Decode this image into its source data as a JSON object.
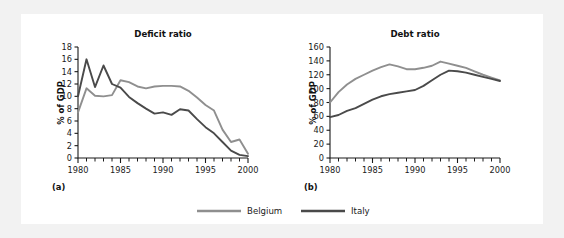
{
  "figure": {
    "background_color": "#f2f2f2",
    "panel_color": "#ffffff",
    "legend": {
      "items": [
        {
          "label": "Belgium",
          "color": "#8f8f8f"
        },
        {
          "label": "Italy",
          "color": "#4a4a4a"
        }
      ]
    }
  },
  "panels": [
    {
      "tag": "(a)",
      "title": "Deficit ratio"
    },
    {
      "tag": "(b)",
      "title": "Debt ratio"
    }
  ],
  "chart_data": [
    {
      "type": "line",
      "title": "Deficit ratio",
      "panel_tag": "(a)",
      "xlabel": "",
      "ylabel": "% of GDP",
      "xlim": [
        1980,
        2000
      ],
      "ylim": [
        0,
        18
      ],
      "ytick_step": 2,
      "yticks": [
        0,
        2,
        4,
        6,
        8,
        10,
        12,
        14,
        16,
        18
      ],
      "xticks_labeled": [
        1980,
        1985,
        1990,
        1995,
        2000
      ],
      "xticks_minor_every": 1,
      "grid": false,
      "legend_position": "bottom-center-shared",
      "x": [
        1980,
        1981,
        1982,
        1983,
        1984,
        1985,
        1986,
        1987,
        1988,
        1989,
        1990,
        1991,
        1992,
        1993,
        1994,
        1995,
        1996,
        1997,
        1998,
        1999,
        2000
      ],
      "series": [
        {
          "name": "Belgium",
          "color": "#8f8f8f",
          "values": [
            7.4,
            11.3,
            10.1,
            10.0,
            10.2,
            12.6,
            12.3,
            11.6,
            11.3,
            11.6,
            11.7,
            11.7,
            11.6,
            10.9,
            9.8,
            8.6,
            7.7,
            4.6,
            2.6,
            3.0,
            0.7
          ]
        },
        {
          "name": "Italy",
          "color": "#4a4a4a",
          "values": [
            10.0,
            16.0,
            11.5,
            15.0,
            12.0,
            11.4,
            9.9,
            8.9,
            8.0,
            7.2,
            7.4,
            7.0,
            7.9,
            7.7,
            6.3,
            5.0,
            4.0,
            2.6,
            1.2,
            0.5,
            0.3
          ]
        }
      ]
    },
    {
      "type": "line",
      "title": "Debt ratio",
      "panel_tag": "(b)",
      "xlabel": "",
      "ylabel": "% of GDP",
      "xlim": [
        1980,
        2000
      ],
      "ylim": [
        0,
        160
      ],
      "ytick_step": 20,
      "yticks": [
        0,
        20,
        40,
        60,
        80,
        100,
        120,
        140,
        160
      ],
      "xticks_labeled": [
        1980,
        1985,
        1990,
        1995,
        2000
      ],
      "xticks_minor_every": 1,
      "grid": false,
      "legend_position": "bottom-center-shared",
      "x": [
        1980,
        1981,
        1982,
        1983,
        1984,
        1985,
        1986,
        1987,
        1988,
        1989,
        1990,
        1991,
        1992,
        1993,
        1994,
        1995,
        1996,
        1997,
        1998,
        1999,
        2000
      ],
      "series": [
        {
          "name": "Belgium",
          "color": "#8f8f8f",
          "values": [
            80,
            95,
            106,
            114,
            120,
            126,
            131,
            135,
            132,
            128,
            128,
            130,
            133,
            139,
            136,
            133,
            130,
            125,
            120,
            116,
            112
          ]
        },
        {
          "name": "Italy",
          "color": "#4a4a4a",
          "values": [
            59,
            62,
            68,
            72,
            78,
            84,
            89,
            92,
            94,
            96,
            98,
            104,
            112,
            120,
            126,
            125,
            123,
            120,
            117,
            114,
            111
          ]
        }
      ]
    }
  ]
}
